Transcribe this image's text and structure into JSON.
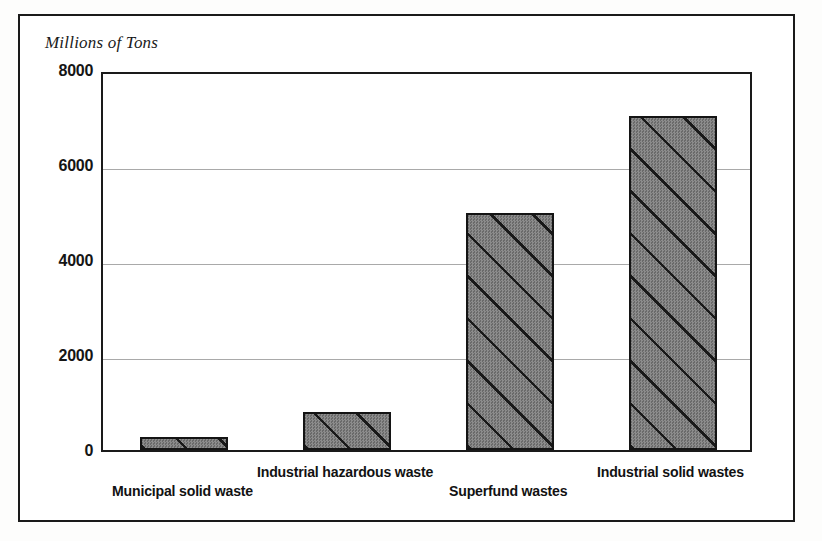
{
  "chart_data": {
    "type": "bar",
    "title": "Millions of Tons",
    "subtitle": "",
    "xlabel": "",
    "ylabel": "Millions of Tons",
    "categories": [
      "Municipal solid waste",
      "Industrial hazardous waste",
      "Superfund wastes",
      "Industrial solid wastes"
    ],
    "values": [
      280,
      800,
      5000,
      7030
    ],
    "ylim": [
      0,
      8000
    ],
    "yticks": [
      0,
      2000,
      4000,
      6000,
      8000
    ],
    "ytick_labels": [
      "0",
      "2000",
      "4000",
      "6000",
      "8000"
    ],
    "grid": true,
    "grid_axis": "y",
    "legend": false,
    "legend_position": "none",
    "orientation": "vertical",
    "bar_style": {
      "fill_color": "#7d7d7d",
      "hatch": "diagonal-up-right",
      "hatch_color": "#141414",
      "border_color": "#141414"
    },
    "axis_color": "#1a1a1a",
    "gridline_color": "#a9a9a9",
    "frame_color": "#1a1a1a",
    "background_color": "#ffffff",
    "label_rows": [
      1,
      0,
      1,
      0
    ]
  }
}
